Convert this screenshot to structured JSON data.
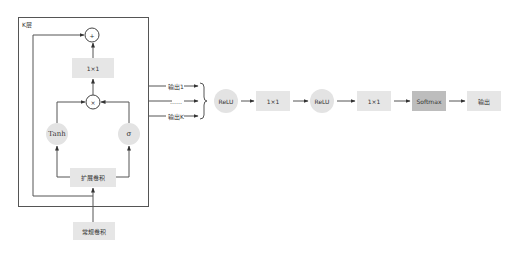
{
  "diagram": {
    "layer_label": "K层",
    "plus_symbol": "+",
    "times_symbol": "×",
    "gate_conv_label": "1×1",
    "tanh_label": "Tanh",
    "sigma_label": "σ",
    "dilated_conv_label": "扩展卷积",
    "regular_conv_label": "常规卷积",
    "outputs": [
      "输出1",
      "……",
      "输出K"
    ],
    "pipeline": [
      {
        "label": "ReLU",
        "shape": "circle"
      },
      {
        "label": "1×1",
        "shape": "box"
      },
      {
        "label": "ReLU",
        "shape": "circle"
      },
      {
        "label": "1×1",
        "shape": "box"
      },
      {
        "label": "Softmax",
        "shape": "box-dark"
      },
      {
        "label": "输出",
        "shape": "box"
      }
    ]
  }
}
